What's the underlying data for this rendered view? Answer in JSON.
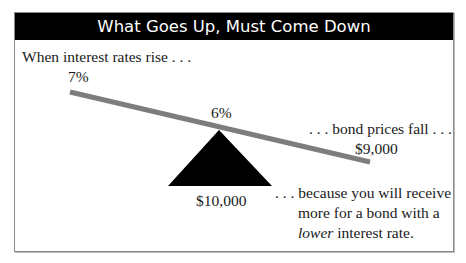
{
  "title": "What Goes Up, Must Come Down",
  "labels": {
    "intro": "When interest rates rise . . .",
    "rate_high": "7%",
    "rate_mid": "6%",
    "price_fall": ". . . bond prices fall . . .",
    "price_low": "$9,000",
    "price_par": "$10,000",
    "because_line1": ". . . because you will receive",
    "because_line2": "more for a bond with a",
    "because_line3_emph": "lower",
    "because_line3_rest": " interest rate."
  },
  "colors": {
    "header_bg": "#000000",
    "header_text": "#ffffff",
    "seesaw_bar": "#7d7d7d",
    "fulcrum": "#000000"
  }
}
